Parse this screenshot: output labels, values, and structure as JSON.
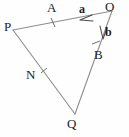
{
  "figure": {
    "background_color": "#fefefe",
    "stroke_color": "#8d8d8d",
    "label_color": "#1c1c1c",
    "width": 129,
    "height": 137
  },
  "points": {
    "P": {
      "label": "P",
      "x": 12,
      "y": 29
    },
    "A": {
      "label": "A",
      "x": 53,
      "y": 15
    },
    "O": {
      "label": "O",
      "x": 111,
      "y": 9
    },
    "B": {
      "label": "B",
      "x": 99,
      "y": 47
    },
    "N": {
      "label": "N",
      "x": 44,
      "y": 72
    },
    "Q": {
      "label": "Q",
      "x": 75,
      "y": 116
    }
  },
  "vectors": {
    "a": {
      "label": "a",
      "from": "O",
      "to": "A",
      "bold": true
    },
    "b": {
      "label": "b",
      "from": "O",
      "to": "B",
      "bold": true
    }
  },
  "segments": [
    {
      "name": "PO",
      "from": "P",
      "to": "O"
    },
    {
      "name": "PQ",
      "from": "P",
      "to": "Q"
    },
    {
      "name": "OQ",
      "from": "O",
      "to": "Q"
    }
  ],
  "tick_marks": [
    {
      "on": "PO",
      "at": "A"
    },
    {
      "on": "OQ",
      "at": "B"
    },
    {
      "on": "PQ",
      "at": "N"
    }
  ]
}
